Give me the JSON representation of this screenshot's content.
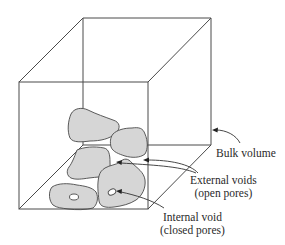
{
  "diagram": {
    "type": "3d-box-with-particles",
    "colors": {
      "line": "#4a4a4a",
      "particle_fill": "#d6d6d6",
      "background": "#ffffff",
      "text": "#2a2a2a"
    },
    "labels": {
      "bulk_volume": "Bulk volume",
      "external_voids_line1": "External voids",
      "external_voids_line2": "(open pores)",
      "internal_void_line1": "Internal void",
      "internal_void_line2": "(closed pores)"
    },
    "particles": [
      {
        "id": "particle-top-left",
        "has_internal_void": false
      },
      {
        "id": "particle-top-right",
        "has_internal_void": false
      },
      {
        "id": "particle-middle-left",
        "has_internal_void": false
      },
      {
        "id": "particle-bottom-left",
        "has_internal_void": true
      },
      {
        "id": "particle-bottom-right",
        "has_internal_void": true
      }
    ]
  }
}
